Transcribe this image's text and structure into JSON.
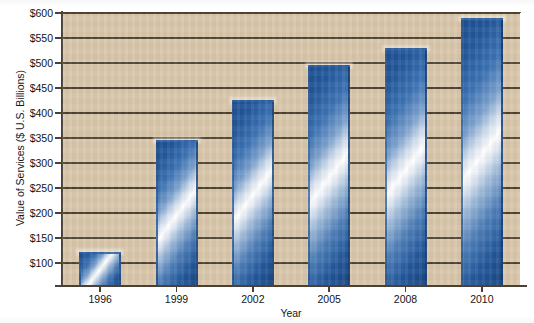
{
  "figure": {
    "title_remnant": "",
    "background_color": "#d9c6aa",
    "gridline_color": "#4d4232",
    "axis_color": "#4a4034",
    "bar_color_dark": "#1d4f92",
    "bar_color_highlight": "#ffffff"
  },
  "chart_data": {
    "type": "bar",
    "title": "",
    "xlabel": "Year",
    "ylabel": "Value of Services ($ U.S. Billions)",
    "categories": [
      "1996",
      "1999",
      "2002",
      "2005",
      "2008",
      "2010"
    ],
    "values": [
      122,
      346,
      427,
      496,
      531,
      590
    ],
    "ylim": [
      56,
      600
    ],
    "yticks": [
      100,
      150,
      200,
      250,
      300,
      350,
      400,
      450,
      500,
      550,
      600
    ],
    "ytick_labels": [
      "$100",
      "$150",
      "$200",
      "$250",
      "$300",
      "$350",
      "$400",
      "$450",
      "$500",
      "$550",
      "$600"
    ],
    "grid": true,
    "grid_axis": "y",
    "legend": false,
    "legend_position": "none",
    "series": [
      {
        "name": "Value of Services",
        "values": [
          122,
          346,
          427,
          496,
          531,
          590
        ]
      }
    ]
  }
}
